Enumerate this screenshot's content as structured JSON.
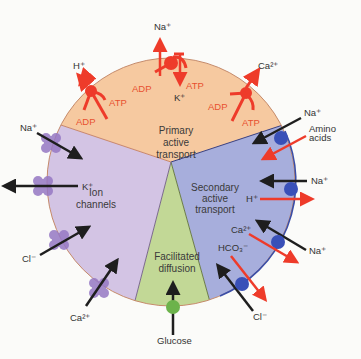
{
  "colors": {
    "primary": "#f6c9a0",
    "ion": "#d3c4e4",
    "secondary": "#a7aedc",
    "facilitated": "#c2d896",
    "pump": "#ee3b2a",
    "channel": "#9678c4",
    "carrier_blue": "#3950b8",
    "carrier_green": "#6cb34b",
    "arrow_dark": "#1e1e1e"
  },
  "sections": {
    "primary": [
      "Primary",
      "active",
      "transport"
    ],
    "ion": [
      "Ion",
      "channels"
    ],
    "secondary": [
      "Secondary",
      "active",
      "transport"
    ],
    "facilitated": [
      "Facilitated",
      "diffusion"
    ]
  },
  "primary_pumps": {
    "h": {
      "ion": "H⁺",
      "adp": "ADP",
      "atp": "ATP"
    },
    "na_k": {
      "ion_out": "Na⁺",
      "ion_in": "K⁺",
      "adp": "ADP",
      "atp": "ATP"
    },
    "ca": {
      "ion": "Ca²⁺",
      "adp": "ADP",
      "atp": "ATP"
    }
  },
  "ion_channels": [
    "Na⁺",
    "K⁺",
    "Cl⁻",
    "Ca²⁺"
  ],
  "secondary_transporters": {
    "t1": {
      "a": "Na⁺",
      "b1": "Amino",
      "b2": "acids"
    },
    "t2": {
      "a": "Na⁺",
      "b": "H⁺"
    },
    "t3": {
      "a": "Ca²⁺",
      "b": "Na⁺"
    },
    "t4": {
      "a": "HCO₃⁻",
      "b": "Cl⁻"
    }
  },
  "facilitated": {
    "substrate": "Glucose"
  }
}
